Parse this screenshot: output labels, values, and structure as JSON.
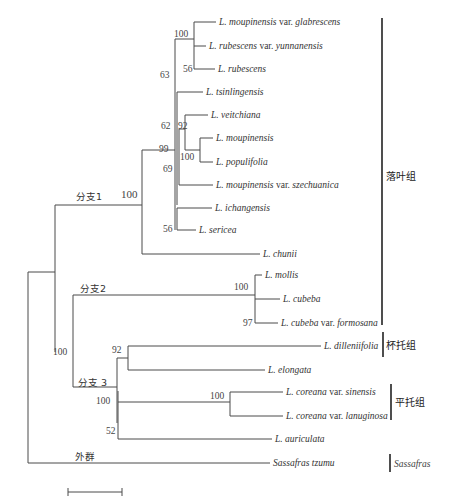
{
  "title": "",
  "groups": [
    {
      "label": "落叶组"
    },
    {
      "label": "杯托组"
    },
    {
      "label": "平托组"
    },
    {
      "label": "Sassafras",
      "italic": true
    }
  ],
  "clade_labels": {
    "c1": "分支1",
    "c2": "分支2",
    "c3": "分支 3",
    "out": "外群"
  },
  "supports": {
    "s100_top": "100",
    "s56_rub": "56",
    "s63": "63",
    "s62": "62",
    "s92_veit": "92",
    "s99": "99",
    "s100_moup": "100",
    "s69": "69",
    "s56_ser": "56",
    "s100_c1": "100",
    "s100_c2": "100",
    "s97": "97",
    "s100_root": "100",
    "s92_dill": "92",
    "s100_c3": "100",
    "s100_cor": "100",
    "s52": "52"
  },
  "taxa": [
    {
      "genus": "L.",
      "epithet": "moupinensis",
      "rank": "var.",
      "infra": "glabrescens"
    },
    {
      "genus": "L.",
      "epithet": "rubescens",
      "rank": "var.",
      "infra": "yunnanensis"
    },
    {
      "genus": "L.",
      "epithet": "rubescens",
      "rank": "",
      "infra": ""
    },
    {
      "genus": "L.",
      "epithet": "tsinlingensis",
      "rank": "",
      "infra": ""
    },
    {
      "genus": "L.",
      "epithet": "veitchiana",
      "rank": "",
      "infra": ""
    },
    {
      "genus": "L.",
      "epithet": "moupinensis",
      "rank": "",
      "infra": ""
    },
    {
      "genus": "L.",
      "epithet": "populifolia",
      "rank": "",
      "infra": ""
    },
    {
      "genus": "L.",
      "epithet": "moupinensis",
      "rank": "var.",
      "infra": "szechuanica"
    },
    {
      "genus": "L.",
      "epithet": "ichangensis",
      "rank": "",
      "infra": ""
    },
    {
      "genus": "L.",
      "epithet": "sericea",
      "rank": "",
      "infra": ""
    },
    {
      "genus": "L.",
      "epithet": "chunii",
      "rank": "",
      "infra": ""
    },
    {
      "genus": "L.",
      "epithet": "mollis",
      "rank": "",
      "infra": ""
    },
    {
      "genus": "L.",
      "epithet": "cubeba",
      "rank": "",
      "infra": ""
    },
    {
      "genus": "L.",
      "epithet": "cubeba",
      "rank": "var.",
      "infra": "formosana"
    },
    {
      "genus": "L.",
      "epithet": "dilleniifolia",
      "rank": "",
      "infra": ""
    },
    {
      "genus": "L.",
      "epithet": "elongata",
      "rank": "",
      "infra": ""
    },
    {
      "genus": "L.",
      "epithet": "coreana",
      "rank": "var.",
      "infra": "sinensis"
    },
    {
      "genus": "L.",
      "epithet": "coreana",
      "rank": "var.",
      "infra": "lanuginosa"
    },
    {
      "genus": "L.",
      "epithet": "auriculata",
      "rank": "",
      "infra": ""
    },
    {
      "genus": "Sassafras",
      "epithet": "tzumu",
      "rank": "",
      "infra": ""
    }
  ],
  "scale_bar": {
    "label": ""
  }
}
